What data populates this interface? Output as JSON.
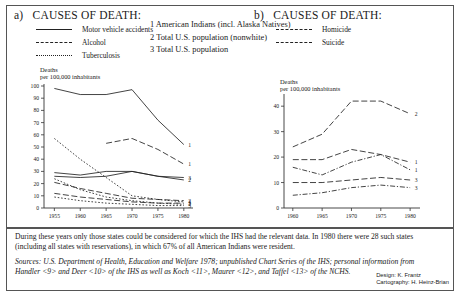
{
  "panels": {
    "a": {
      "label": "a)",
      "title": "CAUSES OF DEATH:"
    },
    "b": {
      "label": "b)",
      "title": "CAUSES OF DEATH:"
    }
  },
  "legend_a": [
    {
      "label": "Motor vehicle accidents",
      "style": "solid"
    },
    {
      "label": "Alcohol",
      "style": "dash"
    },
    {
      "label": "Tuberculosis",
      "style": "dot"
    }
  ],
  "legend_b": [
    {
      "label": "Homicide",
      "style": "dash"
    },
    {
      "label": "Suicide",
      "style": "dashdot"
    }
  ],
  "key": [
    "1 American Indians (incl. Alaska Natives)",
    "2 Total U.S. population (nonwhite)",
    "3 Total U.S. population"
  ],
  "axis_caption": {
    "line1": "Deaths",
    "line2": "per 100,000 inhabitants"
  },
  "notes": {
    "note1": "During these years only those states could be considered for which the IHS had the relevant data. In 1980 there were 28 such states (including all states with reservations), in which 67% of all American Indians were resident.",
    "sources": "Sources: U.S. Department of Health, Education and Welfare 1978; unpublished Chart Series of the IHS; personal information from Handler <9> and Deer <10> of the IHS as well as Koch <11>, Maurer <12>, and Taffel <13> of the NCHS."
  },
  "credits": {
    "design": "Design: K. Frantz",
    "cartography": "Cartography: H. Heinz-Brian"
  },
  "chart_data": [
    {
      "type": "line",
      "id": "chart-a",
      "title": "a) CAUSES OF DEATH:",
      "xlabel": "",
      "ylabel": "Deaths per 100,000 inhabitants",
      "x": [
        1955,
        1960,
        1965,
        1970,
        1975,
        1980
      ],
      "xticks": [
        "1955",
        "1960",
        "1965",
        "1970",
        "1975",
        "1980"
      ],
      "yticks": [
        0,
        10,
        20,
        30,
        40,
        50,
        60,
        70,
        80,
        90,
        100
      ],
      "xlim": [
        1953,
        1981
      ],
      "ylim": [
        0,
        100
      ],
      "grid": false,
      "legend_position": "top-left",
      "series": [
        {
          "name": "Motor vehicle accidents - American Indians",
          "style": "solid",
          "endlabel": "1",
          "x": [
            1955,
            1960,
            1965,
            1970,
            1975,
            1980
          ],
          "values": [
            98,
            93,
            93,
            97,
            72,
            52
          ]
        },
        {
          "name": "Motor vehicle accidents - Total U.S. population (nonwhite)",
          "style": "solid",
          "endlabel": "2",
          "x": [
            1955,
            1960,
            1965,
            1970,
            1975,
            1980
          ],
          "values": [
            26,
            25,
            26,
            30,
            26,
            23
          ]
        },
        {
          "name": "Motor vehicle accidents - Total U.S. population",
          "style": "solid",
          "endlabel": "3",
          "x": [
            1955,
            1960,
            1965,
            1970,
            1975,
            1980
          ],
          "values": [
            29,
            27,
            30,
            30,
            26,
            25
          ]
        },
        {
          "name": "Alcohol - American Indians",
          "style": "dash",
          "endlabel": "1",
          "x": [
            1965,
            1970,
            1975,
            1980
          ],
          "values": [
            53,
            57,
            48,
            36
          ]
        },
        {
          "name": "Alcohol - Total U.S. population (nonwhite)",
          "style": "dash",
          "endlabel": "2",
          "x": [
            1955,
            1960,
            1965,
            1970,
            1975,
            1980
          ],
          "values": [
            21,
            16,
            12,
            8,
            7,
            6
          ]
        },
        {
          "name": "Alcohol - Total U.S. population",
          "style": "dash",
          "endlabel": "3",
          "x": [
            1955,
            1960,
            1965,
            1970,
            1975,
            1980
          ],
          "values": [
            12,
            9,
            7,
            5,
            4,
            4
          ]
        },
        {
          "name": "Tuberculosis - American Indians",
          "style": "dot",
          "endlabel": "1",
          "x": [
            1955,
            1960,
            1965,
            1970,
            1975,
            1980
          ],
          "values": [
            57,
            40,
            25,
            10,
            7,
            5
          ]
        },
        {
          "name": "Tuberculosis - Total U.S. population (nonwhite)",
          "style": "dot",
          "endlabel": "2",
          "x": [
            1955,
            1960,
            1965,
            1970,
            1975,
            1980
          ],
          "values": [
            24,
            15,
            9,
            6,
            4,
            3
          ]
        },
        {
          "name": "Tuberculosis - Total U.S. population",
          "style": "dot",
          "endlabel": "3",
          "x": [
            1955,
            1960,
            1965,
            1970,
            1975,
            1980
          ],
          "values": [
            9,
            6,
            4,
            3,
            2,
            2
          ]
        }
      ]
    },
    {
      "type": "line",
      "id": "chart-b",
      "title": "b) CAUSES OF DEATH:",
      "xlabel": "",
      "ylabel": "Deaths per 100,000 inhabitants",
      "x": [
        1960,
        1965,
        1970,
        1975,
        1980
      ],
      "xticks": [
        "1960",
        "1965",
        "1970",
        "1975",
        "1980"
      ],
      "yticks": [
        0,
        10,
        20,
        30,
        40
      ],
      "xlim": [
        1958.5,
        1981
      ],
      "ylim": [
        0,
        44
      ],
      "grid": false,
      "legend_position": "top-left",
      "series": [
        {
          "name": "Homicide - Total U.S. population (nonwhite)",
          "style": "dash",
          "endlabel": "2",
          "x": [
            1960,
            1965,
            1970,
            1975,
            1980
          ],
          "values": [
            24,
            29,
            42,
            42,
            37
          ]
        },
        {
          "name": "Homicide - American Indians",
          "style": "dash",
          "endlabel": "1",
          "x": [
            1960,
            1965,
            1970,
            1975,
            1980
          ],
          "values": [
            19,
            19,
            23,
            21,
            18
          ]
        },
        {
          "name": "Homicide - Total U.S. population",
          "style": "dash",
          "endlabel": "3",
          "x": [
            1960,
            1965,
            1970,
            1975,
            1980
          ],
          "values": [
            10,
            10,
            11,
            12,
            11
          ]
        },
        {
          "name": "Suicide - American Indians",
          "style": "dashdot",
          "endlabel": "1",
          "x": [
            1960,
            1965,
            1970,
            1975,
            1980
          ],
          "values": [
            16,
            13,
            18,
            21,
            15
          ]
        },
        {
          "name": "Suicide - Total U.S. population",
          "style": "dashdot",
          "endlabel": "3",
          "x": [
            1960,
            1965,
            1970,
            1975,
            1980
          ],
          "values": [
            5,
            6,
            8,
            9,
            8
          ]
        }
      ]
    }
  ]
}
